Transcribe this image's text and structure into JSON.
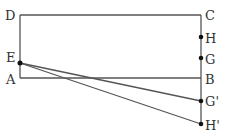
{
  "diagram": {
    "colors": {
      "line": "#555555",
      "point": "#111111",
      "background": "#ffffff"
    },
    "points": {
      "A": {
        "label": "A",
        "x": 20,
        "y": 78
      },
      "B": {
        "label": "B",
        "x": 201,
        "y": 78
      },
      "C": {
        "label": "C",
        "x": 201,
        "y": 15
      },
      "D": {
        "label": "D",
        "x": 20,
        "y": 15
      },
      "E": {
        "label": "E",
        "x": 20,
        "y": 63
      },
      "H": {
        "label": "H",
        "x": 201,
        "y": 37
      },
      "G": {
        "label": "G",
        "x": 201,
        "y": 58
      },
      "G_prime": {
        "label": "G'",
        "x": 201,
        "y": 101
      },
      "H_prime": {
        "label": "H'",
        "x": 201,
        "y": 124
      }
    },
    "segments": [
      [
        "D",
        "C"
      ],
      [
        "D",
        "A"
      ],
      [
        "A",
        "B"
      ],
      [
        "C",
        "H_prime"
      ],
      [
        "E",
        "G_prime"
      ],
      [
        "E",
        "H_prime"
      ]
    ]
  }
}
